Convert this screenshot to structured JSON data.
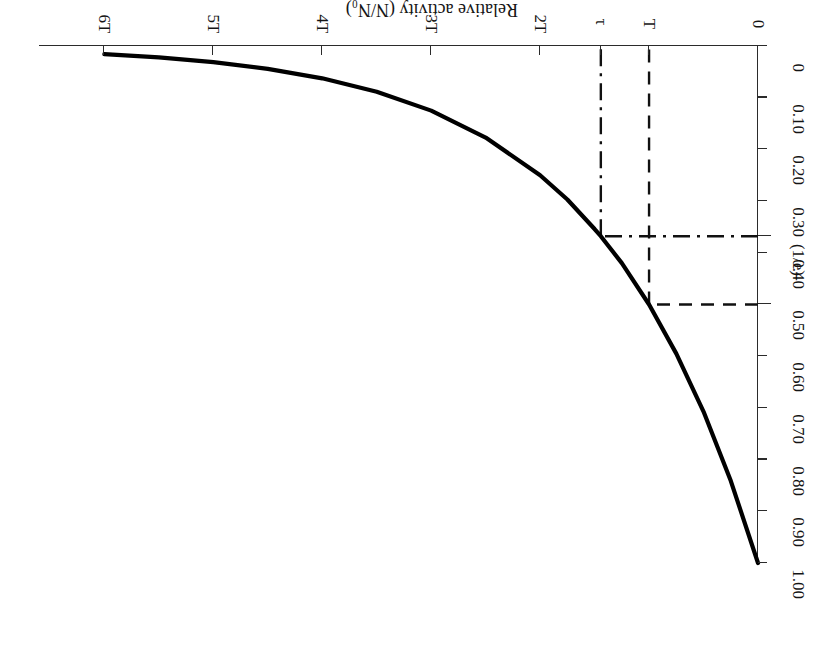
{
  "figure": {
    "rotation_note": "180",
    "y_axis_title": "Relative activity (N/N₀)",
    "x_axis_title": ""
  },
  "axes": {
    "x": {
      "label": "",
      "tick_labels": [
        "0",
        "T",
        "τ",
        "2T",
        "3T",
        "4T",
        "5T",
        "6T"
      ],
      "tick_values": [
        0,
        1,
        1.4427,
        2,
        3,
        4,
        5,
        6
      ],
      "range": [
        0,
        6.6
      ]
    },
    "y": {
      "label": "Relative activity (N/N₀)",
      "tick_labels": [
        "0",
        "0.10",
        "0.20",
        "0.30",
        "(1/e)",
        "0.40",
        "0.50",
        "0.60",
        "0.70",
        "0.80",
        "0.90",
        "1.00"
      ],
      "tick_values": [
        0,
        0.1,
        0.2,
        0.3,
        0.3679,
        0.4,
        0.5,
        0.6,
        0.7,
        0.8,
        0.9,
        1.0
      ],
      "range": [
        0,
        1.0
      ]
    }
  },
  "markers": {
    "half_life": {
      "x_label": "T",
      "y_label": "0.50",
      "x": 1,
      "y": 0.5,
      "style": "dashed"
    },
    "mean_life": {
      "x_label": "τ",
      "y_label": "(1/e)",
      "x": 1.4427,
      "y": 0.3679,
      "style": "dash-dot"
    }
  },
  "colors": {
    "curve": "#000000",
    "axis": "#2b2b2b",
    "guide": "#111111",
    "background": "#ffffff"
  },
  "chart_data": {
    "type": "line",
    "title": "",
    "subtitle": "",
    "xlabel": "",
    "ylabel": "Relative activity (N/N₀)",
    "xlim": [
      0,
      6.6
    ],
    "ylim": [
      0,
      1.0
    ],
    "grid": false,
    "legend": null,
    "x_tick_labels": [
      "0",
      "T",
      "τ",
      "2T",
      "3T",
      "4T",
      "5T",
      "6T"
    ],
    "x_tick_values": [
      0,
      1,
      1.4427,
      2,
      3,
      4,
      5,
      6
    ],
    "y_tick_labels": [
      "0",
      "0.10",
      "0.20",
      "0.30",
      "(1/e)",
      "0.40",
      "0.50",
      "0.60",
      "0.70",
      "0.80",
      "0.90",
      "1.00"
    ],
    "y_tick_values": [
      0,
      0.1,
      0.2,
      0.3,
      0.3679,
      0.4,
      0.5,
      0.6,
      0.7,
      0.8,
      0.9,
      1.0
    ],
    "series": [
      {
        "name": "N/N₀ = 2^(-t/T)",
        "x": [
          0,
          0.25,
          0.5,
          0.75,
          1.0,
          1.25,
          1.4427,
          1.5,
          1.75,
          2.0,
          2.5,
          3.0,
          3.5,
          4.0,
          4.5,
          5.0,
          5.5,
          6.0
        ],
        "values": [
          1.0,
          0.841,
          0.707,
          0.595,
          0.5,
          0.42,
          0.3679,
          0.354,
          0.297,
          0.25,
          0.177,
          0.125,
          0.0884,
          0.0625,
          0.0442,
          0.03125,
          0.0221,
          0.015625
        ]
      }
    ],
    "annotations": [
      {
        "text": "T",
        "type": "x-marker",
        "x": 1,
        "y": 0.5,
        "style": "dashed"
      },
      {
        "text": "0.50",
        "type": "y-marker",
        "x": 1,
        "y": 0.5,
        "style": "dashed"
      },
      {
        "text": "τ",
        "type": "x-marker",
        "x": 1.4427,
        "y": 0.3679,
        "style": "dash-dot"
      },
      {
        "text": "(1/e)",
        "type": "y-marker",
        "x": 1.4427,
        "y": 0.3679,
        "style": "dash-dot"
      }
    ]
  }
}
